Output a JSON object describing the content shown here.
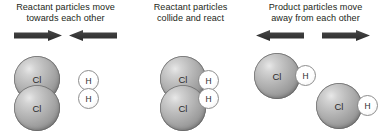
{
  "diagram": {
    "atom_labels": {
      "chlorine": "Cl",
      "hydrogen": "H"
    },
    "colors": {
      "chlorine_sphere": "#a8a8a8",
      "hydrogen_sphere": "#ffffff",
      "arrow": "#3b3b3b",
      "text": "#231f20",
      "background": "#ffffff"
    },
    "panels": [
      {
        "id": "reactants-approach",
        "caption_line1": "Reactant particles move",
        "caption_line2": "towards each other",
        "arrows": [
          {
            "name": "arrow-right",
            "direction": "right"
          },
          {
            "name": "arrow-left",
            "direction": "left"
          }
        ],
        "molecules": [
          {
            "name": "chlorine-molecule",
            "formula": "Cl2",
            "atoms": [
              "Cl",
              "Cl"
            ]
          },
          {
            "name": "hydrogen-molecule",
            "formula": "H2",
            "atoms": [
              "H",
              "H"
            ]
          }
        ]
      },
      {
        "id": "collision",
        "caption_line1": "Reactant particles",
        "caption_line2": "collide and react",
        "arrows": [],
        "molecules": [
          {
            "name": "chlorine-molecule",
            "formula": "Cl2",
            "atoms": [
              "Cl",
              "Cl"
            ]
          },
          {
            "name": "hydrogen-molecule",
            "formula": "H2",
            "atoms": [
              "H",
              "H"
            ]
          }
        ]
      },
      {
        "id": "products-separate",
        "caption_line1": "Product particles move",
        "caption_line2": "away from each other",
        "arrows": [
          {
            "name": "arrow-left",
            "direction": "left"
          },
          {
            "name": "arrow-right",
            "direction": "right"
          }
        ],
        "molecules": [
          {
            "name": "hydrogen-chloride-molecule",
            "formula": "HCl",
            "atoms": [
              "Cl",
              "H"
            ]
          },
          {
            "name": "hydrogen-chloride-molecule",
            "formula": "HCl",
            "atoms": [
              "Cl",
              "H"
            ]
          }
        ]
      }
    ]
  }
}
